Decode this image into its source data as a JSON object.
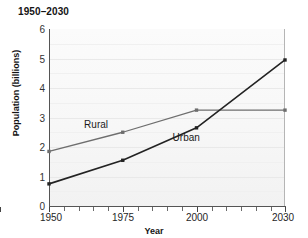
{
  "chart_data": {
    "type": "line",
    "title": "1950–2030",
    "xlabel": "Year",
    "ylabel": "Population (billions)",
    "x": [
      1950,
      1975,
      2000,
      2030
    ],
    "categories": [
      "1950",
      "1975",
      "2000",
      "2030"
    ],
    "xtick_labels": [
      "1950",
      "1975",
      "2000",
      "2030"
    ],
    "ytick_labels": [
      "0",
      "1",
      "2",
      "3",
      "4",
      "5",
      "6"
    ],
    "xlim": [
      1950,
      2030
    ],
    "ylim": [
      0,
      6
    ],
    "grid": true,
    "legend": "inline-annotations",
    "series": [
      {
        "name": "Rural",
        "values": [
          1.85,
          2.5,
          3.25,
          3.25
        ],
        "color": "#6e6e6e",
        "marker": "square"
      },
      {
        "name": "Urban",
        "values": [
          0.75,
          1.55,
          2.65,
          4.95
        ],
        "color": "#232323",
        "marker": "square"
      }
    ],
    "annotations": [
      {
        "text": "Rural",
        "x": 1968,
        "y": 2.72
      },
      {
        "text": "Urban",
        "x": 1998,
        "y": 2.28
      }
    ]
  }
}
